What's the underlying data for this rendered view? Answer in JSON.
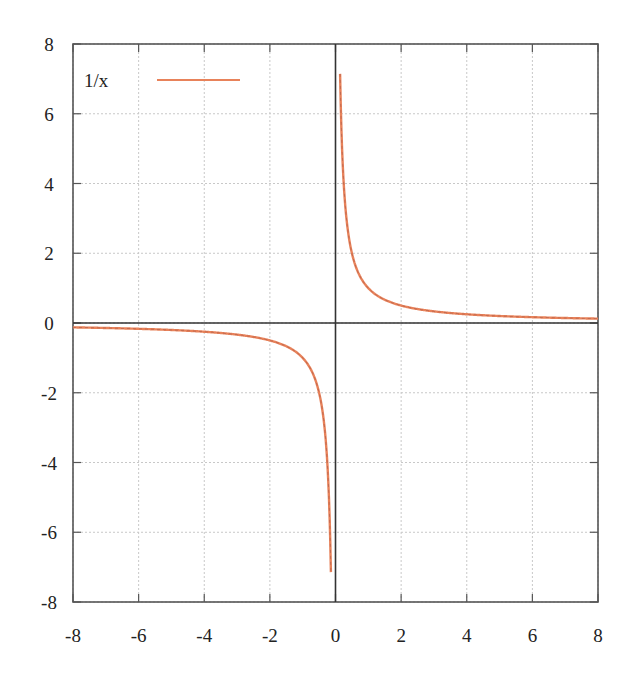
{
  "chart_data": {
    "type": "line",
    "title": "",
    "xlabel": "",
    "ylabel": "",
    "xlim": [
      -8,
      8
    ],
    "ylim": [
      -8,
      8
    ],
    "grid": true,
    "legend_position": "upper-left",
    "x_ticks": [
      "-8",
      "-6",
      "-4",
      "-2",
      "0",
      "2",
      "4",
      "6",
      "8"
    ],
    "y_ticks": [
      "8",
      "6",
      "4",
      "2",
      "0",
      "-2",
      "-4",
      "-6",
      "-8"
    ],
    "series": [
      {
        "name": "1/x",
        "color": "#e8825a",
        "function": "1/x",
        "x": [
          -8,
          -6,
          -4,
          -2,
          -1,
          -0.5,
          -0.25,
          -0.125,
          0.125,
          0.25,
          0.5,
          1,
          2,
          4,
          6,
          8
        ],
        "values": [
          -0.125,
          -0.167,
          -0.25,
          -0.5,
          -1,
          -2,
          -4,
          -8,
          8,
          4,
          2,
          1,
          0.5,
          0.25,
          0.167,
          0.125
        ]
      }
    ],
    "axes_lines": {
      "x_zero": true,
      "y_zero": true,
      "color": "#333333"
    }
  },
  "legend": {
    "label": "1/x"
  },
  "colors": {
    "curve": "#e8825a",
    "grid": "#c8c8c8",
    "frame": "#555555",
    "axis": "#333333"
  }
}
